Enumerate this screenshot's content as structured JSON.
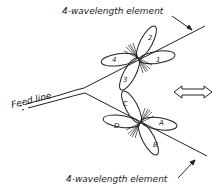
{
  "diagram": {
    "top_element_label": "4-wavelength element",
    "bottom_element_label": "4-wavelength element",
    "feed_line_label": "Feed line",
    "top_lobes": [
      "1",
      "2",
      "3",
      "4"
    ],
    "bottom_lobes": [
      "A",
      "B",
      "C",
      "D"
    ],
    "direction_arrow": "double-headed-arrow",
    "stroke_color": "#222222",
    "background": "#ffffff"
  }
}
